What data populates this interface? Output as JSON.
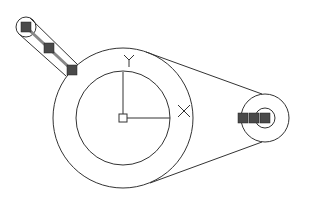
{
  "diagram": {
    "title": "",
    "stroke_color": "#333333",
    "grip_color": "#4a4a4a",
    "axis_labels": {
      "x": "X",
      "y": "Y"
    },
    "big_pulley": {
      "cx": 123,
      "cy": 118,
      "outer_r": 70,
      "inner_r": 47
    },
    "small_pulley": {
      "cx": 265,
      "cy": 118,
      "outer_r": 24,
      "inner_r": 10
    },
    "belt": {
      "upper": {
        "x1": 146,
        "y1": 52,
        "x2": 262,
        "y2": 94
      },
      "lower": {
        "x1": 150,
        "y1": 183,
        "x2": 262,
        "y2": 142
      }
    },
    "ucs_icon": {
      "origin_x": 123,
      "origin_y": 118,
      "x_end": 168,
      "y_top": 72
    },
    "selected_handle": {
      "grips": 3
    },
    "small_pulley_grips": 3
  }
}
